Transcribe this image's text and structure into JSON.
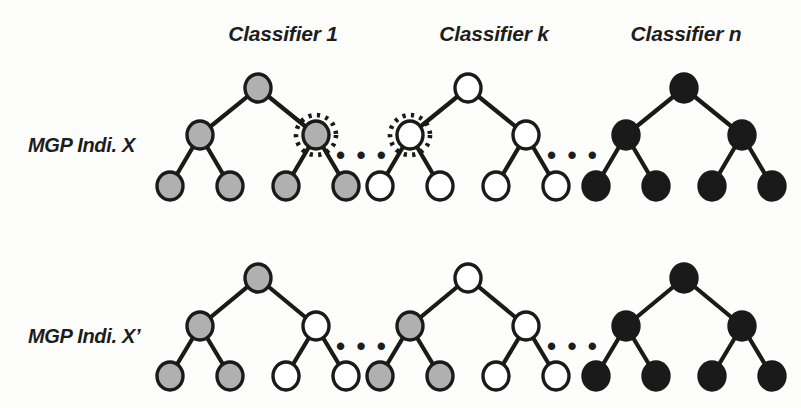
{
  "figure": {
    "width": 801,
    "height": 408,
    "background": "#fdfdfc"
  },
  "palette": {
    "gray": "#b0b0b0",
    "white": "#ffffff",
    "black": "#1a1a1a",
    "outline": "#1a1a1a"
  },
  "column_headers": [
    {
      "label": "Classifier 1",
      "x": 283,
      "y": 22
    },
    {
      "label": "Classifier k",
      "x": 494,
      "y": 22
    },
    {
      "label": "Classifier n",
      "x": 686,
      "y": 22
    }
  ],
  "row_labels": [
    {
      "label": "MGP Indi. X",
      "x": 28,
      "y": 145
    },
    {
      "label": "MGP Indi. X’",
      "x": 28,
      "y": 336
    }
  ],
  "ellipses": [
    {
      "label": "• • •",
      "x": 362,
      "y": 155
    },
    {
      "label": "• • •",
      "x": 573,
      "y": 155
    },
    {
      "label": "• • •",
      "x": 362,
      "y": 346
    },
    {
      "label": "• • •",
      "x": 573,
      "y": 346
    }
  ],
  "geometry": {
    "node_rx": 13,
    "node_ry": 14,
    "halo_r": 20,
    "row_top_y": {
      "root": 88,
      "mid": 135,
      "leaf": 186
    },
    "row_bottom_y": {
      "root": 278,
      "mid": 326,
      "leaf": 376
    }
  },
  "trees": [
    {
      "id": "tree-x-classifier-1",
      "row": "MGP Indi. X",
      "classifier": "Classifier 1",
      "root_x": 258,
      "spread_mid": 58,
      "spread_leaf": 30,
      "row_key": "row_top_y",
      "nodes": [
        {
          "name": "root",
          "pos": "root",
          "fill": "gray",
          "highlight": false
        },
        {
          "name": "left-child",
          "pos": "mid-left",
          "fill": "gray",
          "highlight": false
        },
        {
          "name": "right-child",
          "pos": "mid-right",
          "fill": "gray",
          "highlight": true
        },
        {
          "name": "leaf-1",
          "pos": "leaf-ll",
          "fill": "gray",
          "highlight": false
        },
        {
          "name": "leaf-2",
          "pos": "leaf-lr",
          "fill": "gray",
          "highlight": false
        },
        {
          "name": "leaf-3",
          "pos": "leaf-rl",
          "fill": "gray",
          "highlight": false
        },
        {
          "name": "leaf-4",
          "pos": "leaf-rr",
          "fill": "gray",
          "highlight": false
        }
      ]
    },
    {
      "id": "tree-x-classifier-k",
      "row": "MGP Indi. X",
      "classifier": "Classifier k",
      "root_x": 468,
      "spread_mid": 58,
      "spread_leaf": 30,
      "row_key": "row_top_y",
      "nodes": [
        {
          "name": "root",
          "pos": "root",
          "fill": "white",
          "highlight": false
        },
        {
          "name": "left-child",
          "pos": "mid-left",
          "fill": "white",
          "highlight": true
        },
        {
          "name": "right-child",
          "pos": "mid-right",
          "fill": "white",
          "highlight": false
        },
        {
          "name": "leaf-1",
          "pos": "leaf-ll",
          "fill": "white",
          "highlight": false
        },
        {
          "name": "leaf-2",
          "pos": "leaf-lr",
          "fill": "white",
          "highlight": false
        },
        {
          "name": "leaf-3",
          "pos": "leaf-rl",
          "fill": "white",
          "highlight": false
        },
        {
          "name": "leaf-4",
          "pos": "leaf-rr",
          "fill": "white",
          "highlight": false
        }
      ]
    },
    {
      "id": "tree-x-classifier-n",
      "row": "MGP Indi. X",
      "classifier": "Classifier n",
      "root_x": 684,
      "spread_mid": 58,
      "spread_leaf": 30,
      "row_key": "row_top_y",
      "nodes": [
        {
          "name": "root",
          "pos": "root",
          "fill": "black",
          "highlight": false
        },
        {
          "name": "left-child",
          "pos": "mid-left",
          "fill": "black",
          "highlight": false
        },
        {
          "name": "right-child",
          "pos": "mid-right",
          "fill": "black",
          "highlight": false
        },
        {
          "name": "leaf-1",
          "pos": "leaf-ll",
          "fill": "black",
          "highlight": false
        },
        {
          "name": "leaf-2",
          "pos": "leaf-lr",
          "fill": "black",
          "highlight": false
        },
        {
          "name": "leaf-3",
          "pos": "leaf-rl",
          "fill": "black",
          "highlight": false
        },
        {
          "name": "leaf-4",
          "pos": "leaf-rr",
          "fill": "black",
          "highlight": false
        }
      ]
    },
    {
      "id": "tree-xprime-classifier-1",
      "row": "MGP Indi. X’",
      "classifier": "Classifier 1",
      "root_x": 258,
      "spread_mid": 58,
      "spread_leaf": 30,
      "row_key": "row_bottom_y",
      "nodes": [
        {
          "name": "root",
          "pos": "root",
          "fill": "gray",
          "highlight": false
        },
        {
          "name": "left-child",
          "pos": "mid-left",
          "fill": "gray",
          "highlight": false
        },
        {
          "name": "right-child",
          "pos": "mid-right",
          "fill": "white",
          "highlight": false
        },
        {
          "name": "leaf-1",
          "pos": "leaf-ll",
          "fill": "gray",
          "highlight": false
        },
        {
          "name": "leaf-2",
          "pos": "leaf-lr",
          "fill": "gray",
          "highlight": false
        },
        {
          "name": "leaf-3",
          "pos": "leaf-rl",
          "fill": "white",
          "highlight": false
        },
        {
          "name": "leaf-4",
          "pos": "leaf-rr",
          "fill": "white",
          "highlight": false
        }
      ]
    },
    {
      "id": "tree-xprime-classifier-k",
      "row": "MGP Indi. X’",
      "classifier": "Classifier k",
      "root_x": 468,
      "spread_mid": 58,
      "spread_leaf": 30,
      "row_key": "row_bottom_y",
      "nodes": [
        {
          "name": "root",
          "pos": "root",
          "fill": "white",
          "highlight": false
        },
        {
          "name": "left-child",
          "pos": "mid-left",
          "fill": "gray",
          "highlight": false
        },
        {
          "name": "right-child",
          "pos": "mid-right",
          "fill": "white",
          "highlight": false
        },
        {
          "name": "leaf-1",
          "pos": "leaf-ll",
          "fill": "gray",
          "highlight": false
        },
        {
          "name": "leaf-2",
          "pos": "leaf-lr",
          "fill": "gray",
          "highlight": false
        },
        {
          "name": "leaf-3",
          "pos": "leaf-rl",
          "fill": "white",
          "highlight": false
        },
        {
          "name": "leaf-4",
          "pos": "leaf-rr",
          "fill": "white",
          "highlight": false
        }
      ]
    },
    {
      "id": "tree-xprime-classifier-n",
      "row": "MGP Indi. X’",
      "classifier": "Classifier n",
      "root_x": 684,
      "spread_mid": 58,
      "spread_leaf": 30,
      "row_key": "row_bottom_y",
      "nodes": [
        {
          "name": "root",
          "pos": "root",
          "fill": "black",
          "highlight": false
        },
        {
          "name": "left-child",
          "pos": "mid-left",
          "fill": "black",
          "highlight": false
        },
        {
          "name": "right-child",
          "pos": "mid-right",
          "fill": "black",
          "highlight": false
        },
        {
          "name": "leaf-1",
          "pos": "leaf-ll",
          "fill": "black",
          "highlight": false
        },
        {
          "name": "leaf-2",
          "pos": "leaf-lr",
          "fill": "black",
          "highlight": false
        },
        {
          "name": "leaf-3",
          "pos": "leaf-rl",
          "fill": "black",
          "highlight": false
        },
        {
          "name": "leaf-4",
          "pos": "leaf-rr",
          "fill": "black",
          "highlight": false
        }
      ]
    }
  ]
}
